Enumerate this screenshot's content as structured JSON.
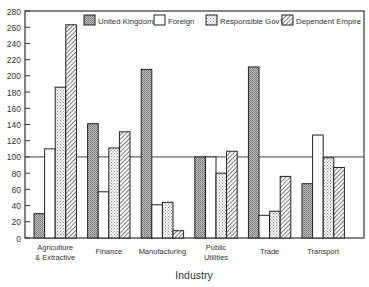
{
  "chart_data": {
    "type": "bar",
    "title": "",
    "xlabel": "Industry",
    "ylabel": "",
    "ylim": [
      0,
      280
    ],
    "yticks": [
      0,
      20,
      40,
      60,
      80,
      100,
      120,
      140,
      160,
      180,
      200,
      220,
      240,
      260,
      280
    ],
    "reference_line": 100,
    "grid": false,
    "legend_position": "top",
    "categories": [
      "Agriculture & Extractive",
      "Finance",
      "Manufacturing",
      "Public Utilities",
      "Trade",
      "Transport"
    ],
    "category_lines": [
      [
        "Agriculture",
        "& Extractive"
      ],
      [
        "Finance"
      ],
      [
        "Manufacturing"
      ],
      [
        "Public",
        "Utilities"
      ],
      [
        "Trade"
      ],
      [
        "Transport"
      ]
    ],
    "series": [
      {
        "name": "United Kingdom",
        "pattern": "dense-hatch",
        "values": [
          30,
          141,
          208,
          100,
          211,
          67
        ]
      },
      {
        "name": "Foreign",
        "pattern": "blank",
        "values": [
          110,
          57,
          41,
          100,
          28,
          127
        ]
      },
      {
        "name": "Responsible Gov't",
        "pattern": "dots",
        "values": [
          186,
          111,
          44,
          80,
          33,
          99
        ]
      },
      {
        "name": "Dependent Empire",
        "pattern": "diagonal-hatch",
        "values": [
          263,
          131,
          9,
          107,
          76,
          87
        ]
      }
    ]
  }
}
